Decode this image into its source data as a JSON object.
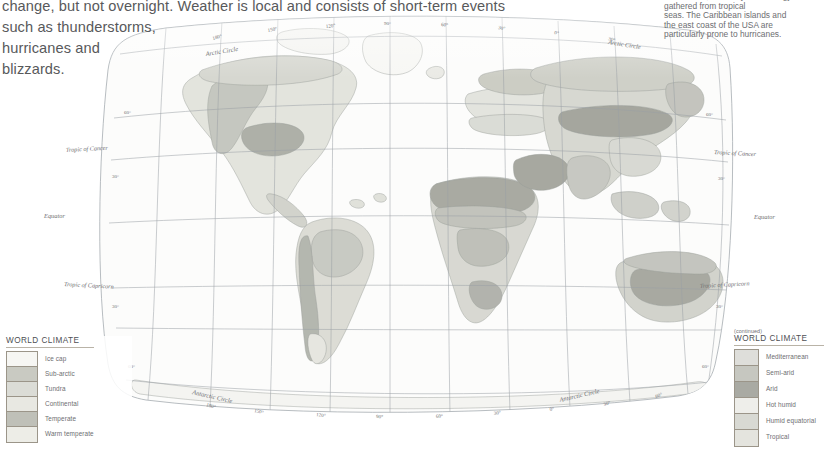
{
  "document": {
    "type": "atlas-page",
    "topic": "World Climate"
  },
  "body_text_left": {
    "lines": [
      "change, but not overnight. Weather is local and consists of short-term events",
      "such as thunderstorms,",
      "hurricanes and",
      "blizzards."
    ]
  },
  "body_text_right": {
    "lines": [
      "windstorms, driven by heat energy",
      "gathered from tropical",
      "seas. The Caribbean islands and",
      "the east coast of the USA are",
      "particularly prone to hurricanes."
    ]
  },
  "map": {
    "name": "world-climate-map",
    "projection": "curved-globe-projection",
    "latitude_labels": [
      "Arctic Circle",
      "Tropic of Cancer",
      "Equator",
      "Tropic of Capricorn",
      "Antarctic Circle"
    ],
    "longitude_labels": [
      "180°",
      "150°",
      "120°",
      "90°",
      "60°",
      "30°",
      "0°",
      "30°",
      "60°",
      "90°",
      "120°",
      "150°",
      "180°"
    ],
    "latitude_ticks": [
      "60°",
      "30°",
      "0°",
      "30°",
      "60°"
    ]
  },
  "legend_left": {
    "title": "WORLD CLIMATE",
    "items": [
      {
        "label": "Ice cap",
        "color": "#f6f6f3"
      },
      {
        "label": "Sub-arctic",
        "color": "#c9cac2"
      },
      {
        "label": "Tundra",
        "color": "#dbdcd6"
      },
      {
        "label": "Continental",
        "color": "#e8e8e2"
      },
      {
        "label": "Temperate",
        "color": "#bfc0b8"
      },
      {
        "label": "Warm temperate",
        "color": "#edede7"
      }
    ]
  },
  "legend_right": {
    "continued_note": "(continued)",
    "title": "WORLD CLIMATE",
    "items": [
      {
        "label": "Mediterranean",
        "color": "#dededa"
      },
      {
        "label": "Semi-arid",
        "color": "#c6c7c0"
      },
      {
        "label": "Arid",
        "color": "#a9aaa3"
      },
      {
        "label": "Hot humid",
        "color": "#eeeeea"
      },
      {
        "label": "Humid equatorial",
        "color": "#d8d9d3"
      },
      {
        "label": "Tropical",
        "color": "#e4e4de"
      }
    ]
  },
  "colors": {
    "page_background": "#ffffff",
    "body_text": "#58595b",
    "caption_text": "#6d6e71",
    "legend_rule": "#b9b3a7",
    "graticule": "#9aa0a6",
    "map_outline": "#8d9398",
    "land_base": "#e9e9e4"
  }
}
